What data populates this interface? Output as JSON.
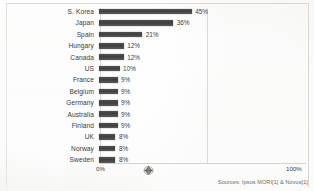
{
  "chart_data": {
    "type": "bar",
    "orientation": "horizontal",
    "title": "",
    "xlabel": "",
    "ylabel": "",
    "xlim": [
      0,
      100
    ],
    "grid": true,
    "legend": null,
    "categories": [
      "S. Korea",
      "Japan",
      "Spain",
      "Hungary",
      "Canada",
      "US",
      "France",
      "Belgium",
      "Germany",
      "Australia",
      "Finland",
      "UK",
      "Norway",
      "Sweden"
    ],
    "values": [
      45,
      36,
      21,
      12,
      12,
      10,
      9,
      9,
      9,
      9,
      9,
      8,
      8,
      8
    ],
    "value_labels": [
      "45%",
      "36%",
      "21%",
      "12%",
      "12%",
      "10%",
      "9%",
      "9%",
      "9%",
      "9%",
      "9%",
      "8%",
      "8%",
      "8%"
    ],
    "axis_ticks": [
      "0%",
      "100%"
    ],
    "bar_color": "#3f3f3f"
  },
  "axis": {
    "min_label": "0%",
    "max_label": "100%"
  },
  "footer": {
    "source": "Sources: Ipsos MORI[1] & Novus[1]"
  },
  "watermark": {
    "name": "diamond-logo"
  }
}
